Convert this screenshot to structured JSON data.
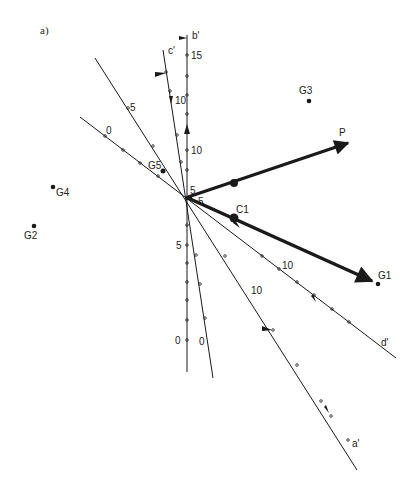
{
  "panel_label": "a)",
  "axes": {
    "b": {
      "label": "b'",
      "ticks": [
        "15",
        "10",
        "5",
        "0"
      ]
    },
    "c": {
      "label": "c'",
      "ticks": [
        "10",
        "0"
      ]
    },
    "a": {
      "label": "a'",
      "ticks": [
        "5",
        "10"
      ]
    },
    "d": {
      "label": "d'",
      "ticks": [
        "0",
        "10"
      ]
    }
  },
  "center_labels": [
    "5",
    "5"
  ],
  "vectors": {
    "P": {
      "label": "P"
    },
    "C1": {
      "label": "C1"
    }
  },
  "points": {
    "G1": "G1",
    "G2": "G2",
    "G3": "G3",
    "G4": "G4",
    "G5": "G5"
  },
  "colors": {
    "ink": "#1a1a1a",
    "background": "#ffffff"
  }
}
